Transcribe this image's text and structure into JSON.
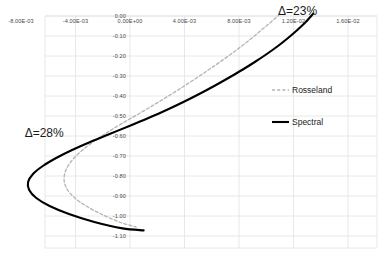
{
  "chart_data": {
    "type": "line",
    "title": "",
    "xlabel": "",
    "ylabel": "",
    "xlim": [
      -0.01,
      0.018
    ],
    "ylim": [
      -1.15,
      0.03
    ],
    "grid": true,
    "legend_position": "right-middle",
    "xticks": [
      {
        "value": -0.008,
        "label": "-8.00E-03"
      },
      {
        "value": -0.004,
        "label": "-4.00E-03"
      },
      {
        "value": 0.0,
        "label": "0.00E+00"
      },
      {
        "value": 0.004,
        "label": "4.00E-03"
      },
      {
        "value": 0.008,
        "label": "8.00E-03"
      },
      {
        "value": 0.012,
        "label": "1.20E-02"
      },
      {
        "value": 0.016,
        "label": "1.60E-02"
      }
    ],
    "yticks": [
      {
        "value": 0.0,
        "label": "0.00"
      },
      {
        "value": -0.1,
        "label": "-0.10"
      },
      {
        "value": -0.2,
        "label": "-0.20"
      },
      {
        "value": -0.3,
        "label": "-0.30"
      },
      {
        "value": -0.4,
        "label": "-0.40"
      },
      {
        "value": -0.5,
        "label": "-0.50"
      },
      {
        "value": -0.6,
        "label": "-0.60"
      },
      {
        "value": -0.7,
        "label": "-0.70"
      },
      {
        "value": -0.8,
        "label": "-0.80"
      },
      {
        "value": -0.9,
        "label": "-0.90"
      },
      {
        "value": -1.0,
        "label": "-1.00"
      },
      {
        "value": -1.1,
        "label": "-1.10"
      }
    ],
    "series": [
      {
        "name": "Rosseland",
        "style": "dashed",
        "color": "#b3b3b3",
        "points": [
          [
            0.011,
            0.01
          ],
          [
            0.01035,
            -0.03
          ],
          [
            0.00965,
            -0.07
          ],
          [
            0.00895,
            -0.11
          ],
          [
            0.0082,
            -0.15
          ],
          [
            0.00742,
            -0.19
          ],
          [
            0.0066,
            -0.23
          ],
          [
            0.00575,
            -0.27
          ],
          [
            0.00488,
            -0.31
          ],
          [
            0.00398,
            -0.35
          ],
          [
            0.00305,
            -0.39
          ],
          [
            0.0021,
            -0.43
          ],
          [
            0.00112,
            -0.47
          ],
          [
            0.0001,
            -0.51
          ],
          [
            -0.0009,
            -0.55
          ],
          [
            -0.00185,
            -0.59
          ],
          [
            -0.00272,
            -0.63
          ],
          [
            -0.00348,
            -0.67
          ],
          [
            -0.0041,
            -0.71
          ],
          [
            -0.00455,
            -0.75
          ],
          [
            -0.0048,
            -0.79
          ],
          [
            -0.00482,
            -0.83
          ],
          [
            -0.00458,
            -0.87
          ],
          [
            -0.00405,
            -0.91
          ],
          [
            -0.00322,
            -0.95
          ],
          [
            -0.00212,
            -0.99
          ],
          [
            -0.00078,
            -1.03
          ],
          [
            0.00045,
            -1.055
          ]
        ]
      },
      {
        "name": "Spectral",
        "style": "solid",
        "color": "#000000",
        "points": [
          [
            0.01345,
            0.012
          ],
          [
            0.0129,
            -0.03
          ],
          [
            0.01228,
            -0.07
          ],
          [
            0.0116,
            -0.11
          ],
          [
            0.01086,
            -0.15
          ],
          [
            0.01004,
            -0.19
          ],
          [
            0.00916,
            -0.23
          ],
          [
            0.00822,
            -0.27
          ],
          [
            0.00722,
            -0.31
          ],
          [
            0.00618,
            -0.35
          ],
          [
            0.00508,
            -0.39
          ],
          [
            0.00392,
            -0.43
          ],
          [
            0.00268,
            -0.47
          ],
          [
            0.00135,
            -0.51
          ],
          [
            -5e-05,
            -0.55
          ],
          [
            -0.0015,
            -0.59
          ],
          [
            -0.00292,
            -0.63
          ],
          [
            -0.00425,
            -0.67
          ],
          [
            -0.00542,
            -0.71
          ],
          [
            -0.0064,
            -0.75
          ],
          [
            -0.00712,
            -0.79
          ],
          [
            -0.00748,
            -0.83
          ],
          [
            -0.0074,
            -0.87
          ],
          [
            -0.00688,
            -0.91
          ],
          [
            -0.0059,
            -0.95
          ],
          [
            -0.00448,
            -0.99
          ],
          [
            -0.00262,
            -1.03
          ],
          [
            -0.00055,
            -1.062
          ],
          [
            0.001,
            -1.072
          ]
        ]
      }
    ],
    "annotations": [
      {
        "text": "Δ=23%",
        "x": 0.0123,
        "y": 0.025
      },
      {
        "text": "Δ=28%",
        "x": -0.0063,
        "y": -0.585
      }
    ]
  }
}
